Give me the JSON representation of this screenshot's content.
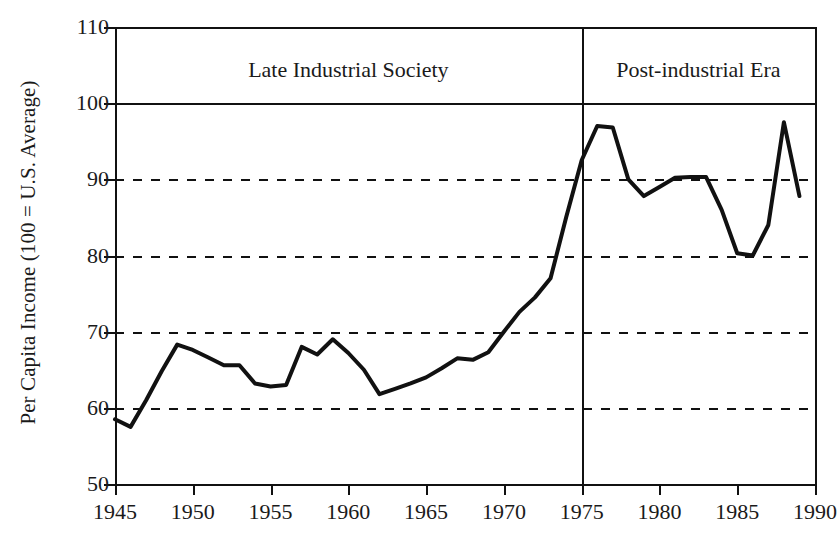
{
  "axes": {
    "ylabel": "Per Capita Income (100 = U.S. Average)",
    "xlabel": "",
    "ytick_labels": [
      "110",
      "100",
      "90",
      "80",
      "70",
      "60",
      "50"
    ],
    "xtick_labels": [
      "1945",
      "1950",
      "1955",
      "1960",
      "1965",
      "1970",
      "1975",
      "1980",
      "1985",
      "1990"
    ]
  },
  "annotations": {
    "era_left": "Late Industrial Society",
    "era_right": "Post-industrial Era",
    "divider_year": 1975
  },
  "colors": {
    "line": "#111111",
    "axis": "#111111",
    "grid": "#111111",
    "background": "#ffffff"
  },
  "chart_data": {
    "type": "line",
    "title": "",
    "subtitle": "",
    "xlabel": "",
    "ylabel": "Per Capita Income (100 = U.S. Average)",
    "xlim": [
      1945,
      1990
    ],
    "ylim": [
      50,
      110
    ],
    "xticks": [
      1945,
      1950,
      1955,
      1960,
      1965,
      1970,
      1975,
      1980,
      1985,
      1990
    ],
    "yticks": [
      50,
      60,
      70,
      80,
      90,
      100,
      110
    ],
    "grid": "horizontal dashed at 60,70,80,90; solid at 100",
    "legend": "none",
    "annotations": [
      {
        "text": "Late Industrial Society",
        "region": [
          1945,
          1975
        ]
      },
      {
        "text": "Post-industrial Era",
        "region": [
          1975,
          1990
        ]
      },
      {
        "text": "vertical divider",
        "x": 1975
      }
    ],
    "x": [
      1945,
      1946,
      1947,
      1948,
      1949,
      1950,
      1951,
      1952,
      1953,
      1954,
      1955,
      1956,
      1957,
      1958,
      1959,
      1960,
      1961,
      1962,
      1963,
      1964,
      1965,
      1966,
      1967,
      1968,
      1969,
      1970,
      1971,
      1972,
      1973,
      1974,
      1975,
      1976,
      1977,
      1978,
      1979,
      1980,
      1981,
      1982,
      1983,
      1984,
      1985,
      1986,
      1987,
      1988,
      1989
    ],
    "values": [
      58.5,
      57.5,
      61.0,
      64.8,
      68.3,
      67.6,
      66.6,
      65.6,
      65.6,
      63.2,
      62.8,
      63.0,
      68.0,
      67.0,
      69.0,
      67.2,
      65.0,
      61.8,
      62.5,
      63.2,
      64.0,
      65.2,
      66.5,
      66.3,
      67.3,
      70.0,
      72.6,
      74.5,
      77.0,
      85.0,
      92.5,
      97.0,
      96.8,
      90.0,
      87.8,
      89.0,
      90.2,
      90.3,
      90.3,
      86.0,
      80.3,
      80.0,
      84.0,
      97.5,
      87.8
    ],
    "series": [
      {
        "name": "Per Capita Income Index",
        "values": [
          58.5,
          57.5,
          61.0,
          64.8,
          68.3,
          67.6,
          66.6,
          65.6,
          65.6,
          63.2,
          62.8,
          63.0,
          68.0,
          67.0,
          69.0,
          67.2,
          65.0,
          61.8,
          62.5,
          63.2,
          64.0,
          65.2,
          66.5,
          66.3,
          67.3,
          70.0,
          72.6,
          74.5,
          77.0,
          85.0,
          92.5,
          97.0,
          96.8,
          90.0,
          87.8,
          89.0,
          90.2,
          90.3,
          90.3,
          86.0,
          80.3,
          80.0,
          84.0,
          97.5,
          87.8
        ]
      }
    ]
  }
}
